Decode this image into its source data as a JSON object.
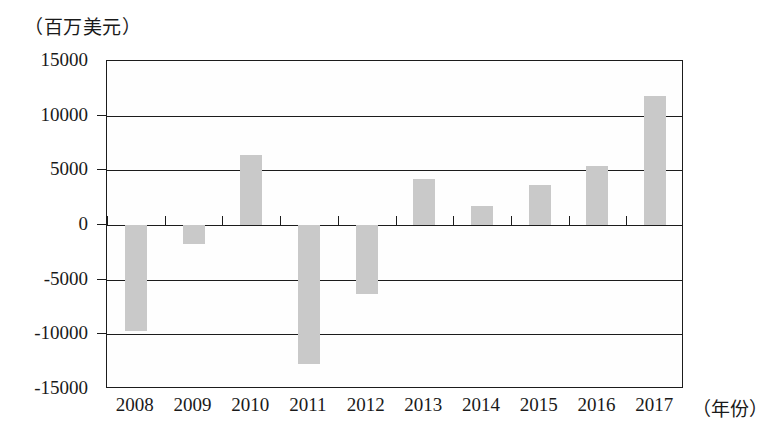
{
  "chart_data": {
    "type": "bar",
    "title": "",
    "subtitle": "",
    "ylabel": "（百万美元）",
    "xlabel": "（年份）",
    "categories": [
      "2008",
      "2009",
      "2010",
      "2011",
      "2012",
      "2013",
      "2014",
      "2015",
      "2016",
      "2017"
    ],
    "values": [
      -9700,
      -1700,
      6400,
      -12700,
      -6300,
      4200,
      1700,
      3700,
      5400,
      11800
    ],
    "ylim": [
      -15000,
      15000
    ],
    "y_ticks": [
      "15000",
      "10000",
      "5000",
      "0",
      "-5000",
      "-10000",
      "-15000"
    ],
    "y_tick_values": [
      15000,
      10000,
      5000,
      0,
      -5000,
      -10000,
      -15000
    ],
    "grid": true,
    "legend": "none",
    "bar_color": "#c9c9c9",
    "axis_color": "#1c1c1c",
    "background_color": "#ffffff"
  }
}
